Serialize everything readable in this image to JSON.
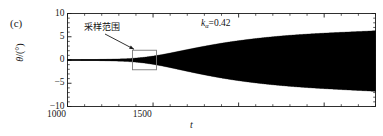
{
  "panel": {
    "label": "(c)"
  },
  "axes": {
    "ylabel_symbol": "θ",
    "ylabel_unit": "/(°)",
    "xlabel": "t",
    "y_ticks": [
      "10",
      "5",
      "0",
      "−5",
      "−10"
    ],
    "y_tick_values": [
      10,
      5,
      0,
      -5,
      -10
    ],
    "x_ticks": [
      "0",
      "500",
      "1000",
      "1500"
    ],
    "x_tick_values": [
      0,
      500,
      1000,
      1500
    ],
    "xlim": [
      0,
      1800
    ],
    "ylim": [
      -10,
      10
    ],
    "minor_ticks": true,
    "grid": false
  },
  "annotations": {
    "sampling_range_label": "采样范围",
    "parameter_symbol": "k",
    "parameter_subscript": "α",
    "parameter_equals": "=0.42",
    "parameter_full": "kα=0.42",
    "box_x_range": [
      380,
      520
    ],
    "box_y_range": [
      -2.1,
      2.1
    ]
  },
  "colors": {
    "curve": "#000000",
    "axis": "#1a1a1a",
    "box": "#7a7a7a",
    "arrow": "#1a1a1a",
    "background": "#ffffff"
  },
  "chart_data": {
    "type": "line",
    "title": "",
    "xlabel": "t",
    "ylabel": "θ/(°)",
    "xlim": [
      0,
      1800
    ],
    "ylim": [
      -10,
      10
    ],
    "grid": false,
    "legend": null,
    "series": [
      {
        "name": "theta",
        "comment": "Dense oscillation; envelope given by upper/lower arrays sampled every 50 time units.",
        "oscillation_period": 13.5,
        "envelope_t": [
          0,
          50,
          100,
          150,
          200,
          250,
          300,
          350,
          400,
          450,
          500,
          550,
          600,
          650,
          700,
          750,
          800,
          850,
          900,
          950,
          1000,
          1050,
          1100,
          1150,
          1200,
          1250,
          1300,
          1350,
          1400,
          1450,
          1500,
          1550,
          1600,
          1650,
          1700,
          1750,
          1800
        ],
        "envelope_upper": [
          0.06,
          0.07,
          0.09,
          0.11,
          0.14,
          0.18,
          0.23,
          0.3,
          0.42,
          0.6,
          0.85,
          1.15,
          1.5,
          1.88,
          2.25,
          2.62,
          2.97,
          3.3,
          3.62,
          3.9,
          4.16,
          4.4,
          4.62,
          4.82,
          5.0,
          5.17,
          5.32,
          5.45,
          5.57,
          5.68,
          5.78,
          5.87,
          5.96,
          6.04,
          6.12,
          6.2,
          6.3
        ],
        "envelope_lower": [
          -0.06,
          -0.07,
          -0.09,
          -0.11,
          -0.14,
          -0.19,
          -0.25,
          -0.33,
          -0.46,
          -0.66,
          -0.93,
          -1.26,
          -1.64,
          -2.04,
          -2.44,
          -2.83,
          -3.2,
          -3.55,
          -3.88,
          -4.18,
          -4.45,
          -4.7,
          -4.93,
          -5.14,
          -5.33,
          -5.5,
          -5.66,
          -5.8,
          -5.93,
          -6.05,
          -6.16,
          -6.26,
          -6.36,
          -6.46,
          -6.55,
          -6.64,
          -6.75
        ]
      }
    ]
  }
}
